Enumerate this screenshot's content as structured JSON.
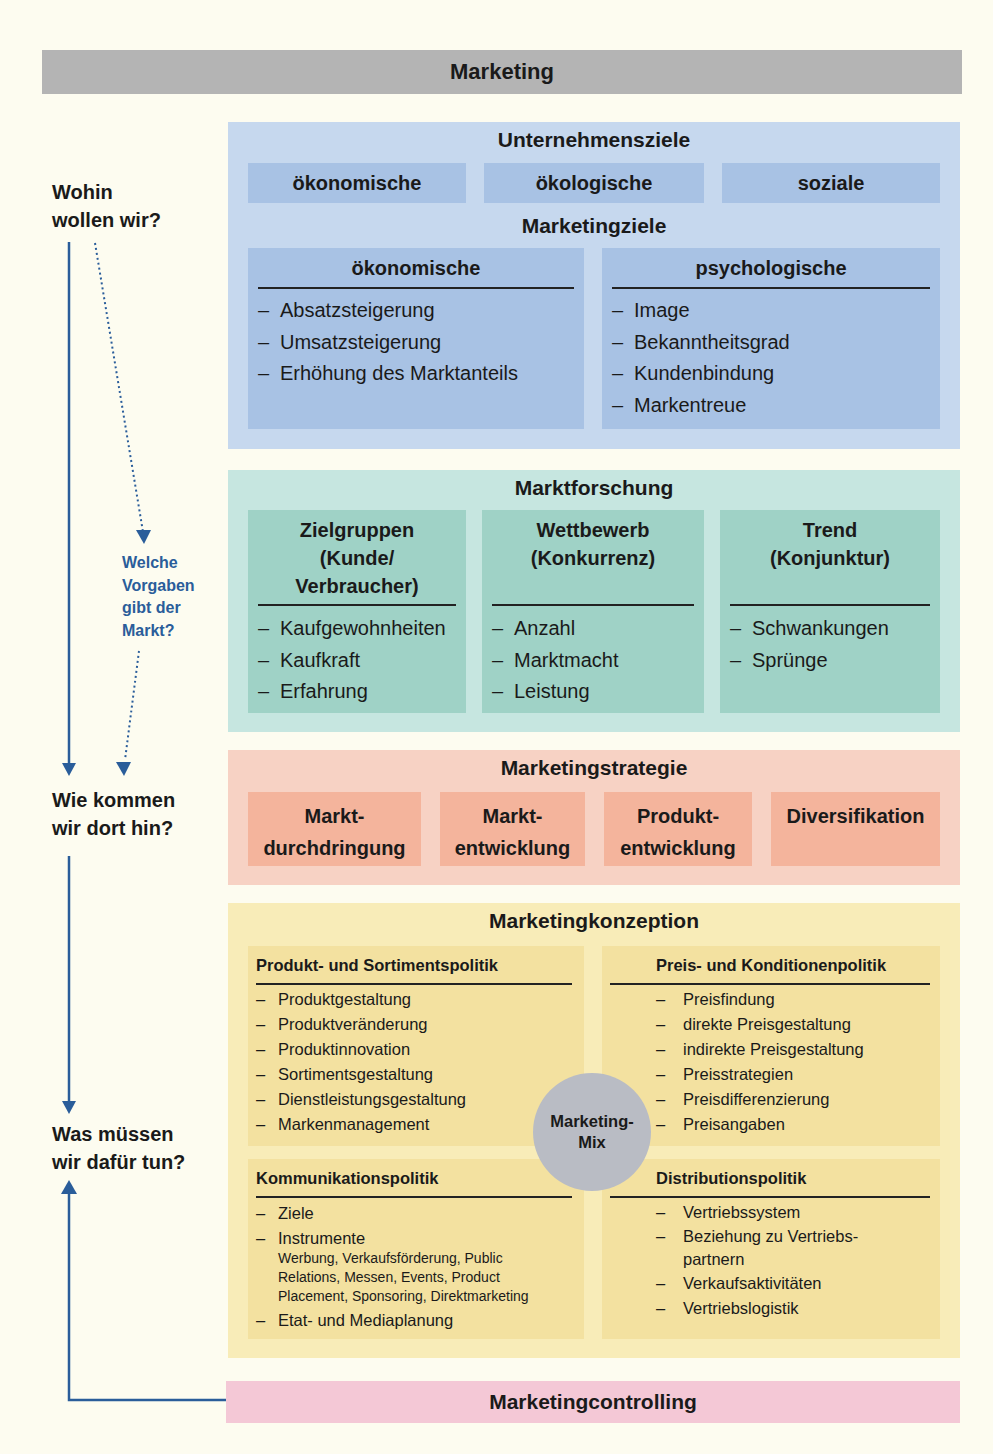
{
  "title": "Marketing",
  "questions": {
    "q1": [
      "Wohin",
      "wollen wir?"
    ],
    "q_market": [
      "Welche",
      "Vorgaben",
      "gibt der",
      "Markt?"
    ],
    "q2": [
      "Wie kommen",
      "wir dort hin?"
    ],
    "q3": [
      "Was müssen",
      "wir dafür tun?"
    ]
  },
  "unternehmensziele": {
    "title": "Unternehmensziele",
    "items": [
      "ökonomische",
      "ökologische",
      "soziale"
    ]
  },
  "marketingziele": {
    "title": "Marketingziele",
    "columns": [
      {
        "head": "ökonomische",
        "items": [
          "Absatzsteigerung",
          "Umsatzsteigerung",
          "Erhöhung des Marktanteils"
        ]
      },
      {
        "head": "psychologische",
        "items": [
          "Image",
          "Bekanntheitsgrad",
          "Kundenbindung",
          "Markentreue"
        ]
      }
    ]
  },
  "marktforschung": {
    "title": "Marktforschung",
    "columns": [
      {
        "head": [
          "Zielgruppen",
          "(Kunde/",
          "Verbraucher)"
        ],
        "items": [
          "Kaufgewohnheiten",
          "Kaufkraft",
          "Erfahrung"
        ]
      },
      {
        "head": [
          "Wettbewerb",
          "(Konkurrenz)"
        ],
        "items": [
          "Anzahl",
          "Marktmacht",
          "Leistung"
        ]
      },
      {
        "head": [
          "Trend",
          "(Konjunktur)"
        ],
        "items": [
          "Schwankungen",
          "Sprünge"
        ]
      }
    ]
  },
  "marketingstrategie": {
    "title": "Marketingstrategie",
    "items": [
      [
        "Markt-",
        "durchdringung"
      ],
      [
        "Markt-",
        "entwicklung"
      ],
      [
        "Produkt-",
        "entwicklung"
      ],
      [
        "Diversifikation"
      ]
    ]
  },
  "marketingkonzeption": {
    "title": "Marketingkonzeption",
    "center": [
      "Marketing-",
      "Mix"
    ],
    "quadrants": {
      "produkt": {
        "head": "Produkt- und Sortimentspolitik",
        "items": [
          "Produktgestaltung",
          "Produktveränderung",
          "Produktinnovation",
          "Sortimentsgestaltung",
          "Dienstleistungsgestaltung",
          "Markenmanagement"
        ]
      },
      "preis": {
        "head": "Preis- und Konditionenpolitik",
        "items": [
          "Preisfindung",
          "direkte Preisgestaltung",
          "indirekte Preisgestaltung",
          "Preisstrategien",
          "Preisdifferenzierung",
          "Preisangaben"
        ]
      },
      "kommunikation": {
        "head": "Kommunikationspolitik",
        "items": [
          "Ziele",
          "Instrumente",
          "Etat- und Mediaplanung"
        ],
        "instrumente_note": [
          "Werbung, Verkaufsförderung, Public",
          "Relations, Messen, Events, Product",
          "Placement, Sponsoring, Direktmarketing"
        ]
      },
      "distribution": {
        "head": "Distributionspolitik",
        "items": [
          "Vertriebssystem",
          "Beziehung zu Vertriebs-",
          "partnern",
          "Verkaufsaktivitäten",
          "Vertriebslogistik"
        ]
      }
    }
  },
  "marketingcontrolling": {
    "title": "Marketingcontrolling"
  },
  "colors": {
    "arrow": "#2a5d9a",
    "blue_section": "#c6d8ee",
    "teal_section": "#c6e6e0",
    "salmon_section": "#f7d2c4",
    "yellow_section": "#f8ecb8",
    "pink_section": "#f4c8d6",
    "title_bar": "#b4b4b4"
  }
}
